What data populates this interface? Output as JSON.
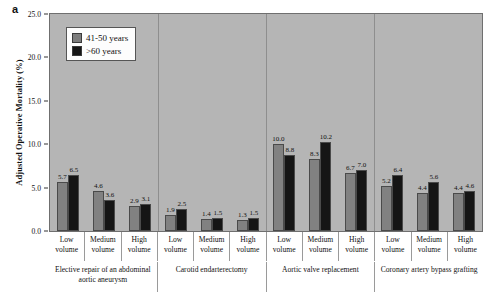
{
  "panel_letter": "a",
  "axes": {
    "ylabel": "Adjusted Operative Mortality (%)",
    "yticks": [
      "0.0",
      "5.0",
      "10.0",
      "15.0",
      "20.0",
      "25.0"
    ],
    "ymin": 0.0,
    "ymax": 25.0
  },
  "legend": {
    "items": [
      {
        "label": "41-50 years",
        "color": "#818181"
      },
      {
        "label": ">60 years",
        "color": "#151515"
      }
    ]
  },
  "volume_labels": {
    "low_line1": "Low",
    "low_line2": "volume",
    "medium_line1": "Medium",
    "medium_line2": "volume",
    "high_line1": "High",
    "high_line2": "volume"
  },
  "chart_data": {
    "type": "bar",
    "title": "",
    "xlabel": "",
    "ylabel": "Adjusted Operative Mortality (%)",
    "ylim": [
      0.0,
      25.0
    ],
    "ytick_step": 5.0,
    "grid": false,
    "legend_position": "top-left",
    "groups": [
      {
        "name": "Elective repair of an abdominal aortic aneurysm",
        "categories": [
          "Low volume",
          "Medium volume",
          "High volume"
        ],
        "series": [
          {
            "name": "41-50 years",
            "values": [
              5.7,
              4.6,
              2.9
            ]
          },
          {
            "name": ">60 years",
            "values": [
              6.5,
              3.6,
              3.1
            ]
          }
        ]
      },
      {
        "name": "Carotid endarterectomy",
        "categories": [
          "Low volume",
          "Medium volume",
          "High volume"
        ],
        "series": [
          {
            "name": "41-50 years",
            "values": [
              1.9,
              1.4,
              1.3
            ]
          },
          {
            "name": ">60 years",
            "values": [
              2.5,
              1.5,
              1.5
            ]
          }
        ]
      },
      {
        "name": "Aortic valve replacement",
        "categories": [
          "Low volume",
          "Medium volume",
          "High volume"
        ],
        "series": [
          {
            "name": "41-50 years",
            "values": [
              10.0,
              8.3,
              6.7
            ]
          },
          {
            "name": ">60 years",
            "values": [
              8.8,
              10.2,
              7.0
            ]
          }
        ]
      },
      {
        "name": "Coronary artery bypass grafting",
        "categories": [
          "Low volume",
          "Medium volume",
          "High volume"
        ],
        "series": [
          {
            "name": "41-50 years",
            "values": [
              5.2,
              4.4,
              4.4
            ]
          },
          {
            "name": ">60 years",
            "values": [
              6.4,
              5.6,
              4.6
            ]
          }
        ]
      }
    ]
  },
  "colors": {
    "plot_background": "#b5b5b5",
    "series_a": "#818181",
    "series_b": "#151515",
    "axis": "#6f6f6f",
    "page_background": "#ffffff"
  }
}
